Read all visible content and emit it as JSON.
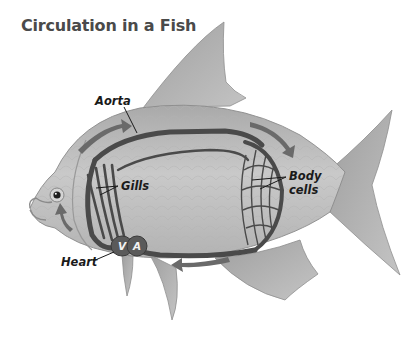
{
  "title": "Circulation in a Fish",
  "labels": {
    "aorta": "Aorta",
    "gills": "Gills",
    "body_cells_line1": "Body",
    "body_cells_line2": "cells",
    "heart": "Heart",
    "ventricle": "V",
    "atrium": "A"
  },
  "colors": {
    "body": "#bdbdbd",
    "fin": "#b0b0b0",
    "vessel": "#4a4a4a",
    "arrow": "#6a6a6a",
    "heart": "#5a5a5a",
    "text": "#1a1a1a"
  }
}
